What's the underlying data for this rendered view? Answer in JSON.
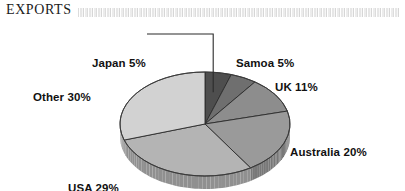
{
  "header": {
    "title": "EXPORTS",
    "band_style": "hatched-rule"
  },
  "chart_data": {
    "type": "pie",
    "title": "EXPORTS",
    "xlabel": "",
    "ylabel": "",
    "style": "3d-grayscale",
    "legend_position": "outside-callout-labels",
    "grid": false,
    "categories": [
      "Japan",
      "Samoa",
      "UK",
      "Australia",
      "USA",
      "Other"
    ],
    "values": [
      5,
      5,
      11,
      20,
      29,
      30
    ],
    "unit": "%",
    "total": 100,
    "slices": [
      {
        "name": "Japan",
        "value": 5,
        "label": "Japan 5%",
        "color": "#4e4e4e",
        "side_color": "#3a3a3a",
        "leader_line": true
      },
      {
        "name": "Samoa",
        "value": 5,
        "label": "Samoa 5%",
        "color": "#6f6f6f",
        "side_color": "#565656",
        "leader_line": false
      },
      {
        "name": "UK",
        "value": 11,
        "label": "UK 11%",
        "color": "#8d8d8d",
        "side_color": "#6e6e6e",
        "leader_line": false
      },
      {
        "name": "Australia",
        "value": 20,
        "label": "Australia 20%",
        "color": "#9a9a9a",
        "side_color": "#787878",
        "leader_line": false
      },
      {
        "name": "USA",
        "value": 29,
        "label": "USA 29%",
        "color": "#b4b4b4",
        "side_color": "#909090",
        "leader_line": false
      },
      {
        "name": "Other",
        "value": 30,
        "label": "Other 30%",
        "color": "#d2d2d2",
        "side_color": "#a8a8a8",
        "leader_line": false
      }
    ]
  },
  "labels": {
    "japan": "Japan 5%",
    "samoa": "Samoa 5%",
    "uk": "UK 11%",
    "australia": "Australia 20%",
    "usa": "USA 29%",
    "other": "Other 30%"
  }
}
